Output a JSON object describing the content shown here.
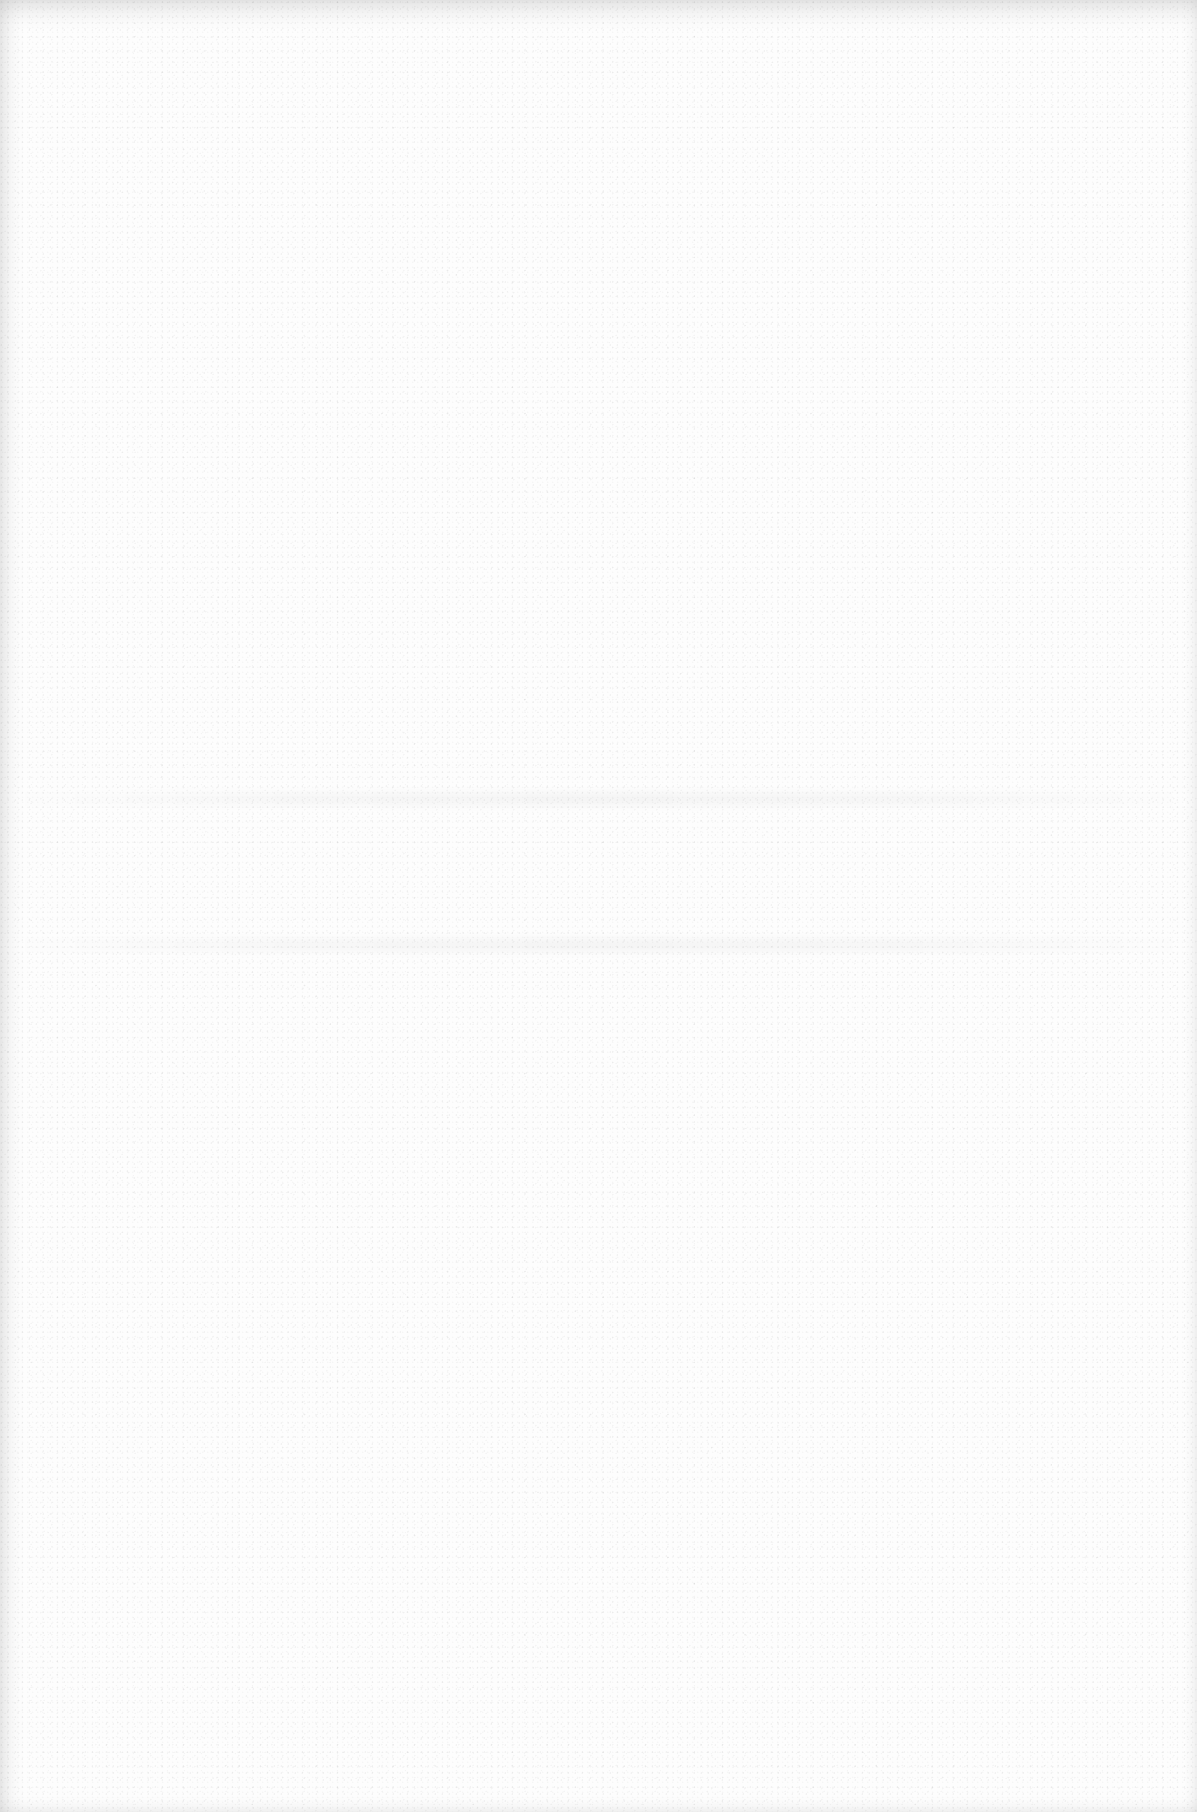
{
  "page": {
    "width": 1197,
    "height": 1812,
    "background_color": "#fdfdfd",
    "edge_shade_color": "#e6e6e6",
    "content": "blank"
  }
}
